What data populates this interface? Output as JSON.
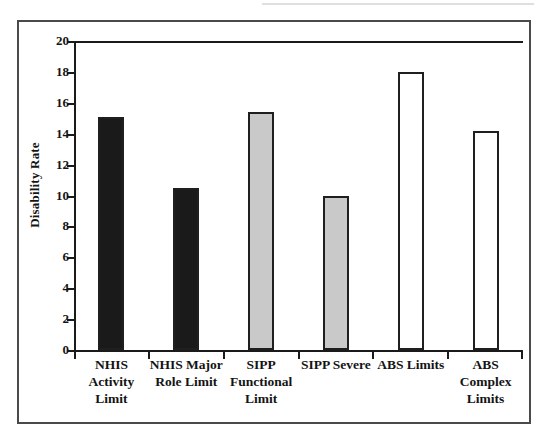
{
  "figure": {
    "background_color": "#ffffff",
    "frame_color": "#4a4a4a"
  },
  "chart_data": {
    "type": "bar",
    "title": "",
    "xlabel": "",
    "ylabel": "Disability Rate",
    "ylim": [
      0,
      20
    ],
    "ytick_step": 2,
    "grid": false,
    "legend": "none",
    "categories": [
      "NHIS\nActivity\nLimit",
      "NHIS Major\nRole Limit",
      "SIPP\nFunctional\nLimit",
      "SIPP Severe",
      "ABS Limits",
      "ABS\nComplex\nLimits"
    ],
    "values": [
      15.1,
      10.5,
      15.4,
      10.0,
      18.0,
      14.2
    ],
    "bar_colors": [
      "#1a1a1a",
      "#1a1a1a",
      "#c9c9c9",
      "#c9c9c9",
      "#ffffff",
      "#ffffff"
    ],
    "bar_edge_color": "#1f1f1f",
    "ytick_labels": [
      "0",
      "2",
      "4",
      "6",
      "8",
      "10",
      "12",
      "14",
      "16",
      "18",
      "20"
    ],
    "ytick_values": [
      0,
      2,
      4,
      6,
      8,
      10,
      12,
      14,
      16,
      18,
      20
    ]
  }
}
